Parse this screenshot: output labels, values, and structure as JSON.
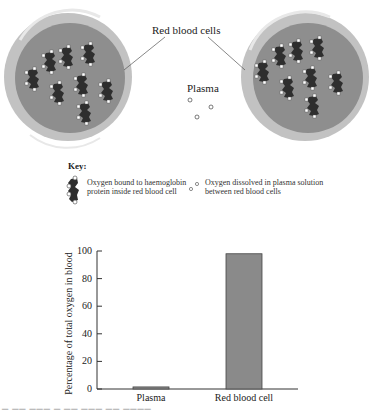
{
  "diagram": {
    "labels": {
      "red_blood_cells": "Red blood cells",
      "plasma": "Plasma"
    },
    "colors": {
      "cell_rim": "#c2c2c2",
      "cell_body": "#8e8e8e",
      "haemoglobin": "#2e2e2e",
      "oxygen_dot": "#ffffff",
      "bar_fill": "#8a8a8a",
      "axis": "#333333"
    },
    "cells": [
      {
        "name": "left-red-blood-cell",
        "cx": 68,
        "cy": 77,
        "r": 64
      },
      {
        "name": "right-red-blood-cell",
        "cx": 305,
        "cy": 77,
        "r": 64
      }
    ]
  },
  "key": {
    "title": "Key:",
    "items": [
      {
        "icon": "haemoglobin-oxygen-icon",
        "line1": "Oxygen bound to haemoglobin",
        "line2": "protein inside red blood cell"
      },
      {
        "icon": "dissolved-oxygen-icon",
        "line1": "Oxygen dissolved in plasma solution",
        "line2": "between red blood cells"
      }
    ]
  },
  "chart_data": {
    "type": "bar",
    "categories": [
      "Plasma",
      "Red blood cell"
    ],
    "values": [
      1.5,
      98
    ],
    "title": "",
    "xlabel": "",
    "ylabel": "Percentage of total oxygen in blood",
    "ylim": [
      0,
      100
    ],
    "yticks": [
      0,
      20,
      40,
      60,
      80,
      100
    ],
    "grid": false,
    "legend": null,
    "bar_color": "#8a8a8a"
  }
}
